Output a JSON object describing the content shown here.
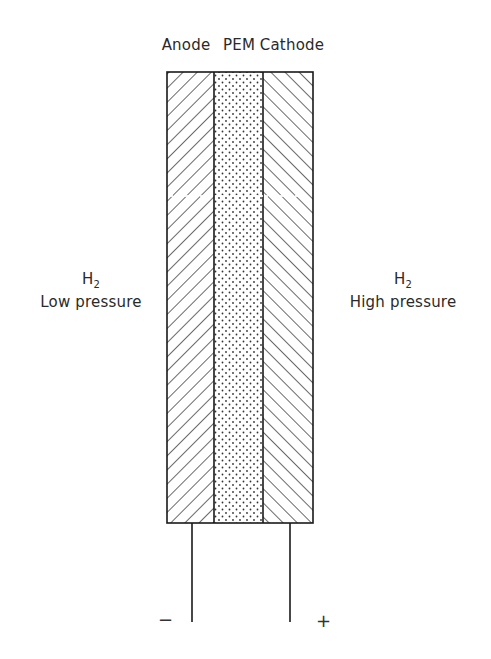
{
  "diagram": {
    "layers": [
      {
        "id": "anode",
        "label": "Anode",
        "pattern": "hatch-down"
      },
      {
        "id": "pem",
        "label": "PEM",
        "pattern": "dots"
      },
      {
        "id": "cathode",
        "label": "Cathode",
        "pattern": "hatch-up"
      }
    ],
    "left_side": {
      "species": "H",
      "subscript": "2",
      "condition": "Low pressure"
    },
    "right_side": {
      "species": "H",
      "subscript": "2",
      "condition": "High pressure"
    },
    "terminals": {
      "negative": "−",
      "positive": "+"
    },
    "colors": {
      "line": "#1a1a1a",
      "text": "#2a2a2a",
      "background": "#ffffff"
    }
  }
}
